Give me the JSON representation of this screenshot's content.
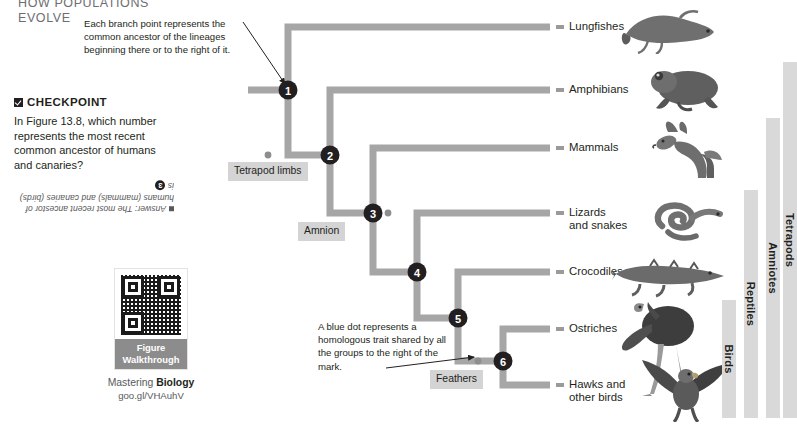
{
  "running_head": {
    "line1": "HOW POPULATIONS",
    "line2": "EVOLVE"
  },
  "callouts": {
    "branch_point": "Each branch point represents the common ancestor of the lineages beginning there or to the right of it.",
    "blue_dot": "A blue dot represents a homologous trait shared by all the groups to the right of the mark."
  },
  "checkpoint": {
    "heading": "CHECKPOINT",
    "check_icon": "checkbox-checked-icon",
    "question": "In Figure 13.8, which number represents the most recent common ancestor of humans and canaries?",
    "answer_prefix": "Answer: The most recent ancestor of humans (mammals) and canaries (birds) is",
    "answer_number": "3"
  },
  "mastering": {
    "qr_icon": "qr-code-icon",
    "caption_line1": "Figure",
    "caption_line2": "Walkthrough",
    "brand_light": "Mastering",
    "brand_bold": "Biology",
    "url": "goo.gl/VHAuhV"
  },
  "tree": {
    "nodes": [
      {
        "id": "1",
        "label": "1",
        "x": 288,
        "y": 90
      },
      {
        "id": "2",
        "label": "2",
        "x": 330,
        "y": 155
      },
      {
        "id": "3",
        "label": "3",
        "x": 373,
        "y": 213
      },
      {
        "id": "4",
        "label": "4",
        "x": 417,
        "y": 272
      },
      {
        "id": "5",
        "label": "5",
        "x": 458,
        "y": 318
      },
      {
        "id": "6",
        "label": "6",
        "x": 503,
        "y": 361
      }
    ],
    "traits": [
      {
        "id": "tetrapod-limbs",
        "label": "Tetrapod limbs",
        "dot_x": 268,
        "dot_y": 155
      },
      {
        "id": "amnion",
        "label": "Amnion",
        "dot_x": 388,
        "dot_y": 213
      },
      {
        "id": "feathers",
        "label": "Feathers",
        "dot_x": 478,
        "dot_y": 361
      }
    ],
    "taxa": [
      {
        "id": "lungfishes",
        "label": "Lungfishes",
        "label2": "",
        "tip_y": 27,
        "animal": "lungfish-illustration"
      },
      {
        "id": "amphibians",
        "label": "Amphibians",
        "label2": "",
        "tip_y": 90,
        "animal": "frog-illustration"
      },
      {
        "id": "mammals",
        "label": "Mammals",
        "label2": "",
        "tip_y": 148,
        "animal": "wolf-illustration"
      },
      {
        "id": "lizards",
        "label": "Lizards",
        "label2": "and snakes",
        "tip_y": 213,
        "animal": "snake-illustration"
      },
      {
        "id": "crocodiles",
        "label": "Crocodiles",
        "label2": "",
        "tip_y": 272,
        "animal": "crocodile-illustration"
      },
      {
        "id": "ostriches",
        "label": "Ostriches",
        "label2": "",
        "tip_y": 329,
        "animal": "ostrich-illustration"
      },
      {
        "id": "hawks",
        "label": "Hawks and",
        "label2": "other birds",
        "tip_y": 385,
        "animal": "hawk-illustration"
      }
    ],
    "groups": [
      {
        "id": "birds",
        "label": "Birds"
      },
      {
        "id": "reptiles",
        "label": "Reptiles"
      },
      {
        "id": "amniotes",
        "label": "Amniotes"
      },
      {
        "id": "tetrapods",
        "label": "Tetrapods"
      }
    ]
  },
  "colors": {
    "branch": "#a6a6a6",
    "node_fill": "#231f20",
    "node_text": "#ffffff",
    "trait_dot": "#8e8e8e",
    "chip_bg": "#d4d4d4",
    "group_bar": "#d9d9d9",
    "caption_bg": "#8c8c8c",
    "text": "#231f20",
    "muted_text": "#58595b"
  }
}
